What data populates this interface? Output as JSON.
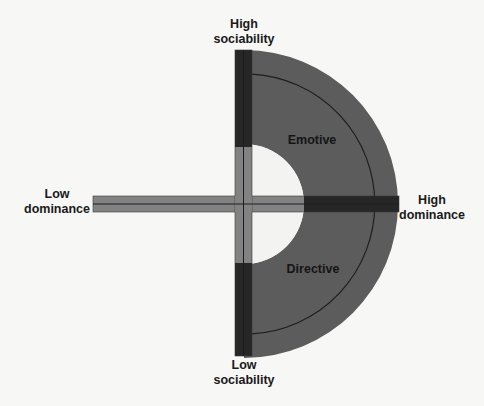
{
  "diagram": {
    "type": "social-style-quadrant",
    "axes": {
      "vertical": {
        "top_label": [
          "High",
          "sociability"
        ],
        "bottom_label": [
          "Low",
          "sociability"
        ]
      },
      "horizontal": {
        "left_label": [
          "Low",
          "dominance"
        ],
        "right_label": [
          "High",
          "dominance"
        ]
      }
    },
    "regions": [
      {
        "name": "Emotive",
        "position": "upper-right"
      },
      {
        "name": "Directive",
        "position": "lower-right"
      }
    ],
    "colors": {
      "background": "#f7f7f5",
      "region_fill": "#5c5c5c",
      "bar_dark": "#262626",
      "bar_light": "#828282",
      "divider_line": "#1e1e1e",
      "center_hole": "#f3f3f1",
      "text": "#1a1a1a"
    }
  }
}
